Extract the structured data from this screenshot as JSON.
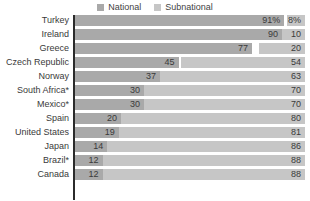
{
  "legend": {
    "entries": [
      {
        "label": "National",
        "color": "#a9a9a9",
        "icon": "square-swatch-icon"
      },
      {
        "label": "Subnational",
        "color": "#c6c6c6",
        "icon": "square-swatch-icon"
      }
    ]
  },
  "colors": {
    "national": "#a9a9a9",
    "subnational": "#c6c6c6",
    "axis": "#2b2b2b",
    "text": "#3a3a3a",
    "background": "#ffffff"
  },
  "chart_data": {
    "type": "bar",
    "orientation": "horizontal",
    "stacked": true,
    "stacked_percent": true,
    "title": "",
    "subtitle": "",
    "xlabel": "",
    "ylabel": "",
    "xlim": [
      0,
      100
    ],
    "grid": false,
    "legend_position": "top-center",
    "categories": [
      "Turkey",
      "Ireland",
      "Greece",
      "Czech Republic",
      "Norway",
      "South Africa*",
      "Mexico*",
      "Spain",
      "United States",
      "Japan",
      "Brazil*",
      "Canada"
    ],
    "series": [
      {
        "name": "National",
        "values": [
          91,
          90,
          77,
          45,
          37,
          30,
          30,
          20,
          19,
          14,
          12,
          12
        ],
        "labels": [
          "91%",
          "90",
          "77",
          "45",
          "37",
          "30",
          "30",
          "20",
          "19",
          "14",
          "12",
          "12"
        ]
      },
      {
        "name": "Subnational",
        "values": [
          8,
          10,
          20,
          54,
          63,
          70,
          70,
          80,
          81,
          86,
          88,
          88
        ],
        "labels": [
          "8%",
          "10",
          "20",
          "54",
          "63",
          "70",
          "70",
          "80",
          "81",
          "86",
          "88",
          "88"
        ]
      }
    ],
    "rows": [
      {
        "category": "Turkey",
        "national": 91,
        "national_label": "91%",
        "subnational": 8,
        "subnational_label": "8%"
      },
      {
        "category": "Ireland",
        "national": 90,
        "national_label": "90",
        "subnational": 10,
        "subnational_label": "10"
      },
      {
        "category": "Greece",
        "national": 77,
        "national_label": "77",
        "subnational": 20,
        "subnational_label": "20"
      },
      {
        "category": "Czech Republic",
        "national": 45,
        "national_label": "45",
        "subnational": 54,
        "subnational_label": "54"
      },
      {
        "category": "Norway",
        "national": 37,
        "national_label": "37",
        "subnational": 63,
        "subnational_label": "63"
      },
      {
        "category": "South Africa*",
        "national": 30,
        "national_label": "30",
        "subnational": 70,
        "subnational_label": "70"
      },
      {
        "category": "Mexico*",
        "national": 30,
        "national_label": "30",
        "subnational": 70,
        "subnational_label": "70"
      },
      {
        "category": "Spain",
        "national": 20,
        "national_label": "20",
        "subnational": 80,
        "subnational_label": "80"
      },
      {
        "category": "United States",
        "national": 19,
        "national_label": "19",
        "subnational": 81,
        "subnational_label": "81"
      },
      {
        "category": "Japan",
        "national": 14,
        "national_label": "14",
        "subnational": 86,
        "subnational_label": "86"
      },
      {
        "category": "Brazil*",
        "national": 12,
        "national_label": "12",
        "subnational": 88,
        "subnational_label": "88"
      },
      {
        "category": "Canada",
        "national": 12,
        "national_label": "12",
        "subnational": 88,
        "subnational_label": "88"
      }
    ]
  }
}
